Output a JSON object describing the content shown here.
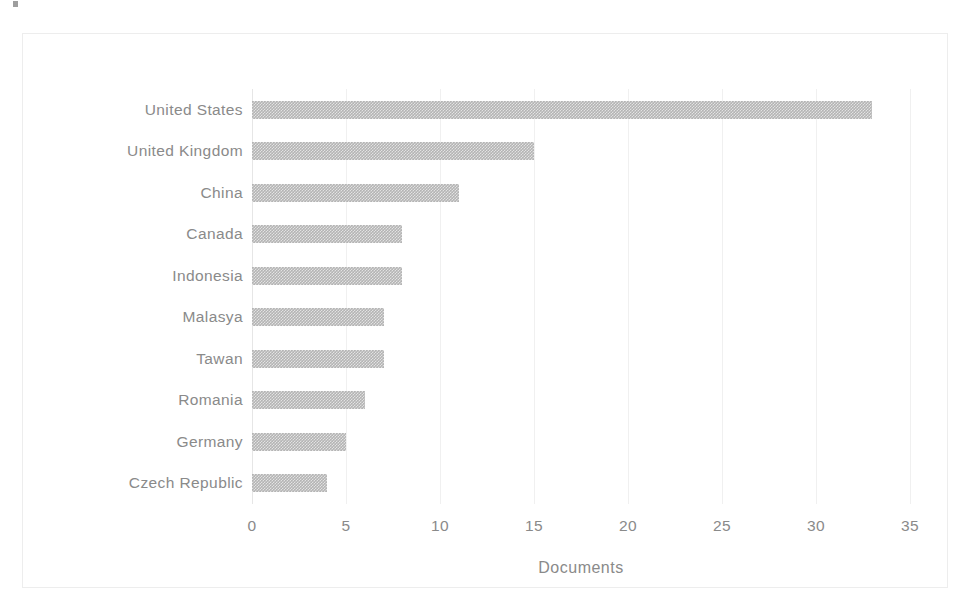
{
  "chart_data": {
    "type": "bar",
    "orientation": "horizontal",
    "title": "",
    "xlabel": "Documents",
    "ylabel": "",
    "xlim": [
      0,
      35
    ],
    "xticks": [
      0,
      5,
      10,
      15,
      20,
      25,
      30,
      35
    ],
    "grid": "vertical-only",
    "legend": "none",
    "bar_color": "#b4b4b4",
    "text_color": "#8a8a8a",
    "categories": [
      "United States",
      "United Kingdom",
      "China",
      "Canada",
      "Indonesia",
      "Malasya",
      "Tawan",
      "Romania",
      "Germany",
      "Czech Republic"
    ],
    "values": [
      33,
      15,
      11,
      8,
      8,
      7,
      7,
      6,
      5,
      4
    ]
  }
}
